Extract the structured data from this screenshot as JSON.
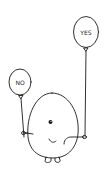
{
  "illustration": {
    "description": "Cartoon egg-shaped character holding two balloons",
    "balloons": [
      {
        "label": "NO",
        "position": "left"
      },
      {
        "label": "YES",
        "position": "right"
      }
    ],
    "colors": {
      "ink": "#1a1a1a",
      "background": "#ffffff"
    }
  }
}
